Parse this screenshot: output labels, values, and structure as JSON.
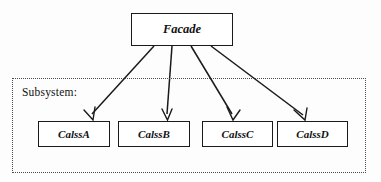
{
  "diagram": {
    "style": {
      "background": "#fdfdfd",
      "node_fill": "#ffffff",
      "node_stroke": "#1a1a1a",
      "edge_stroke": "#1a1a1a",
      "container_stroke": "#4a4a4a",
      "text_color": "#111111"
    },
    "facade": {
      "label": "Facade"
    },
    "subsystem": {
      "label": "Subsystem:",
      "classes": [
        {
          "label": "CalssA"
        },
        {
          "label": "CalssB"
        },
        {
          "label": "CalssC"
        },
        {
          "label": "CalssD"
        }
      ]
    },
    "edges": [
      {
        "from": "Facade",
        "to": "CalssA",
        "arrow": "open"
      },
      {
        "from": "Facade",
        "to": "CalssB",
        "arrow": "open"
      },
      {
        "from": "Facade",
        "to": "CalssC",
        "arrow": "open"
      },
      {
        "from": "Facade",
        "to": "CalssD",
        "arrow": "open"
      }
    ]
  }
}
